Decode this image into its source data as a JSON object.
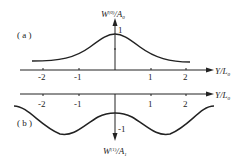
{
  "panel_a": {
    "label": "( a )",
    "y_axis_label": "W(0)/A0",
    "y_axis_label_main": "W",
    "y_axis_label_sup": "(0)",
    "y_axis_label_rest": "/A",
    "y_axis_label_sub": "0",
    "y_tick": "1",
    "x_axis_label": "Y/L",
    "x_axis_label_sub": "0",
    "x_ticks": [
      "-2",
      "-1",
      "1",
      "2"
    ]
  },
  "panel_b": {
    "label": "( b )",
    "y_axis_label_main": "W",
    "y_axis_label_sup": "(1)",
    "y_axis_label_rest": "/A",
    "y_axis_label_sub": "1",
    "y_tick": "-1",
    "x_axis_label": "Y/L",
    "x_axis_label_sub": "0",
    "x_ticks": [
      "-2",
      "-1",
      "1",
      "2"
    ]
  },
  "colors": {
    "line": "#222222"
  }
}
